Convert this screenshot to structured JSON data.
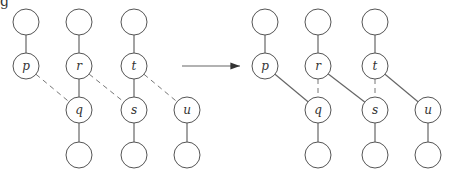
{
  "partial_text": "g",
  "labels": {
    "p": "p",
    "q": "q",
    "r": "r",
    "s": "s",
    "t": "t",
    "u": "u"
  },
  "before": {
    "nodes": [
      {
        "id": "top1",
        "x": 26,
        "y": 22,
        "label": ""
      },
      {
        "id": "top2",
        "x": 79,
        "y": 22,
        "label": ""
      },
      {
        "id": "top3",
        "x": 134,
        "y": 22,
        "label": ""
      },
      {
        "id": "p",
        "x": 26,
        "y": 66,
        "label": "p"
      },
      {
        "id": "r",
        "x": 79,
        "y": 66,
        "label": "r"
      },
      {
        "id": "t",
        "x": 134,
        "y": 66,
        "label": "t"
      },
      {
        "id": "q",
        "x": 79,
        "y": 110,
        "label": "q"
      },
      {
        "id": "s",
        "x": 134,
        "y": 110,
        "label": "s"
      },
      {
        "id": "u",
        "x": 187,
        "y": 110,
        "label": "u"
      },
      {
        "id": "bot1",
        "x": 79,
        "y": 155,
        "label": ""
      },
      {
        "id": "bot2",
        "x": 134,
        "y": 155,
        "label": ""
      },
      {
        "id": "bot3",
        "x": 187,
        "y": 155,
        "label": ""
      }
    ],
    "solid_edges": [
      [
        "top1",
        "p"
      ],
      [
        "top2",
        "r"
      ],
      [
        "top3",
        "t"
      ],
      [
        "r",
        "q"
      ],
      [
        "t",
        "s"
      ],
      [
        "q",
        "bot1"
      ],
      [
        "s",
        "bot2"
      ],
      [
        "u",
        "bot3"
      ]
    ],
    "dashed_edges": [
      [
        "p",
        "q"
      ],
      [
        "r",
        "s"
      ],
      [
        "t",
        "u"
      ]
    ]
  },
  "after": {
    "nodes": [
      {
        "id": "top1",
        "x": 265,
        "y": 22,
        "label": ""
      },
      {
        "id": "top2",
        "x": 318,
        "y": 22,
        "label": ""
      },
      {
        "id": "top3",
        "x": 375,
        "y": 22,
        "label": ""
      },
      {
        "id": "p",
        "x": 265,
        "y": 66,
        "label": "p"
      },
      {
        "id": "r",
        "x": 318,
        "y": 66,
        "label": "r"
      },
      {
        "id": "t",
        "x": 375,
        "y": 66,
        "label": "t"
      },
      {
        "id": "q",
        "x": 318,
        "y": 110,
        "label": "q"
      },
      {
        "id": "s",
        "x": 375,
        "y": 110,
        "label": "s"
      },
      {
        "id": "u",
        "x": 428,
        "y": 110,
        "label": "u"
      },
      {
        "id": "bot1",
        "x": 318,
        "y": 155,
        "label": ""
      },
      {
        "id": "bot2",
        "x": 375,
        "y": 155,
        "label": ""
      },
      {
        "id": "bot3",
        "x": 428,
        "y": 155,
        "label": ""
      }
    ],
    "solid_edges": [
      [
        "top1",
        "p"
      ],
      [
        "top2",
        "r"
      ],
      [
        "top3",
        "t"
      ],
      [
        "p",
        "q"
      ],
      [
        "r",
        "s"
      ],
      [
        "t",
        "u"
      ],
      [
        "q",
        "bot1"
      ],
      [
        "s",
        "bot2"
      ],
      [
        "u",
        "bot3"
      ]
    ],
    "dashed_edges": [
      [
        "r",
        "q"
      ],
      [
        "t",
        "s"
      ]
    ]
  },
  "arrow": {
    "x1": 182,
    "y1": 66,
    "x2": 240,
    "y2": 66
  }
}
